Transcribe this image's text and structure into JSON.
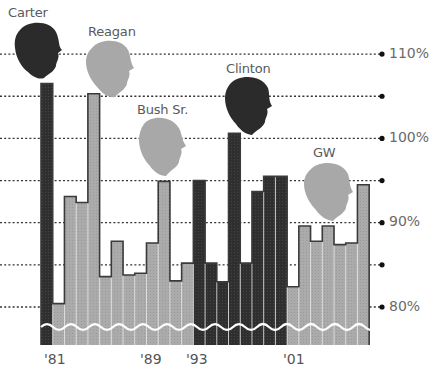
{
  "chart_data": {
    "type": "bar",
    "title": "",
    "xlabel": "",
    "ylabel": "",
    "ylim": [
      77,
      110
    ],
    "grid": true,
    "y_ticks": [
      80,
      85,
      90,
      95,
      100,
      105,
      110
    ],
    "y_tick_labels": [
      "80%",
      "",
      "90%",
      "",
      "100%",
      "",
      "110%"
    ],
    "x_tick_labels": [
      {
        "label": "'81",
        "index": 1
      },
      {
        "label": "'89",
        "index": 9
      },
      {
        "label": "'93",
        "index": 13
      },
      {
        "label": "'01",
        "index": 21
      }
    ],
    "categories": [
      "1980",
      "1981",
      "1982",
      "1983",
      "1984",
      "1985",
      "1986",
      "1987",
      "1988",
      "1989",
      "1990",
      "1991",
      "1992",
      "1993",
      "1994",
      "1995",
      "1996",
      "1997",
      "1998",
      "1999",
      "2000",
      "2001",
      "2002",
      "2003",
      "2004",
      "2005",
      "2006",
      "2007"
    ],
    "values": [
      106.5,
      80.4,
      93.1,
      92.4,
      105.3,
      83.6,
      87.8,
      83.8,
      84.0,
      87.6,
      94.9,
      83.1,
      85.2,
      95.0,
      85.2,
      83.0,
      100.6,
      85.2,
      93.7,
      95.5,
      95.5,
      82.4,
      89.6,
      87.8,
      89.6,
      87.4,
      87.6,
      94.5
    ],
    "party": [
      "D",
      "R",
      "R",
      "R",
      "R",
      "R",
      "R",
      "R",
      "R",
      "R",
      "R",
      "R",
      "R",
      "D",
      "D",
      "D",
      "D",
      "D",
      "D",
      "D",
      "D",
      "R",
      "R",
      "R",
      "R",
      "R",
      "R",
      "R"
    ],
    "presidents": [
      {
        "name": "Carter",
        "party": "D",
        "start_index": 0,
        "end_index": 0
      },
      {
        "name": "Reagan",
        "party": "R",
        "start_index": 1,
        "end_index": 8
      },
      {
        "name": "Bush Sr.",
        "party": "R",
        "start_index": 9,
        "end_index": 12
      },
      {
        "name": "Clinton",
        "party": "D",
        "start_index": 13,
        "end_index": 20
      },
      {
        "name": "GW",
        "party": "R",
        "start_index": 21,
        "end_index": 27
      }
    ],
    "colors": {
      "D": "#2e2e2e",
      "R": "#a9a9a9",
      "outline": "#3a3a3a",
      "grid": "#333333",
      "wave": "#ffffff"
    },
    "annotations": [
      "Carter",
      "Reagan",
      "Bush Sr.",
      "Clinton",
      "GW"
    ]
  },
  "labels": {
    "carter": "Carter",
    "reagan": "Reagan",
    "bush": "Bush Sr.",
    "clinton": "Clinton",
    "gw": "GW",
    "y110": "110%",
    "y100": "100%",
    "y90": "90%",
    "y80": "80%",
    "x81": "'81",
    "x89": "'89",
    "x93": "'93",
    "x01": "'01"
  }
}
